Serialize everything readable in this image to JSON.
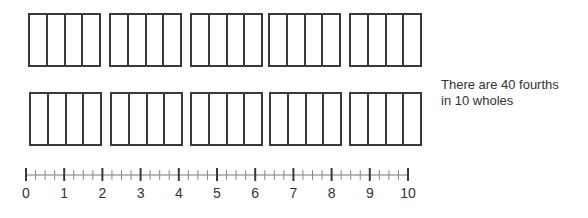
{
  "diagram": {
    "rows": [
      {
        "wholes": 5,
        "parts_per_whole": 4,
        "top": 13,
        "height": 54,
        "lefts": [
          28,
          109,
          190,
          268,
          349
        ],
        "width": 73
      },
      {
        "wholes": 5,
        "parts_per_whole": 4,
        "top": 92,
        "height": 54,
        "lefts": [
          29,
          110,
          190,
          269,
          349
        ],
        "width": 73
      }
    ],
    "caption": {
      "line1": "There are 40 fourths",
      "line2": "in 10 wholes"
    },
    "number_line": {
      "start": 0,
      "end": 10,
      "subdivisions": 4,
      "labels": [
        "0",
        "1",
        "2",
        "3",
        "4",
        "5",
        "6",
        "7",
        "8",
        "9",
        "10"
      ],
      "x0": 26,
      "unit_px": 38.2,
      "line_y": 175
    },
    "colors": {
      "stroke": "#3a3a3a",
      "minor_tick": "#888888",
      "text": "#333333"
    }
  }
}
